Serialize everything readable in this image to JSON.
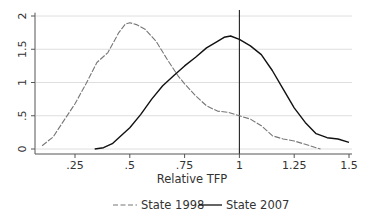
{
  "chart_data": {
    "type": "line",
    "title": "",
    "xlabel": "Relative TFP",
    "ylabel": "",
    "xlim": [
      0.08,
      1.52
    ],
    "ylim": [
      0,
      2.05
    ],
    "grid": true,
    "legend_position": "bottom",
    "x_ticks": [
      0.25,
      0.5,
      0.75,
      1,
      1.25,
      1.5
    ],
    "x_tick_labels": [
      ".25",
      ".5",
      ".75",
      "1",
      "1.25",
      "1.5"
    ],
    "y_ticks": [
      0,
      0.5,
      1,
      1.5,
      2
    ],
    "y_tick_labels": [
      "0",
      ".5",
      "1",
      "1.5",
      "2"
    ],
    "reference_line": {
      "axis": "x",
      "value": 1
    },
    "series": [
      {
        "name": "State 1998",
        "style": "dashed",
        "color": "#777777",
        "x": [
          0.1,
          0.15,
          0.2,
          0.25,
          0.3,
          0.35,
          0.4,
          0.45,
          0.48,
          0.5,
          0.53,
          0.57,
          0.62,
          0.67,
          0.72,
          0.75,
          0.8,
          0.85,
          0.9,
          0.95,
          1.0,
          1.05,
          1.1,
          1.15,
          1.2,
          1.25,
          1.3,
          1.35,
          1.37
        ],
        "y": [
          0.05,
          0.18,
          0.43,
          0.68,
          0.98,
          1.3,
          1.45,
          1.75,
          1.88,
          1.9,
          1.87,
          1.8,
          1.62,
          1.35,
          1.1,
          0.98,
          0.8,
          0.65,
          0.57,
          0.55,
          0.5,
          0.45,
          0.35,
          0.2,
          0.15,
          0.12,
          0.07,
          0.02,
          0.0
        ]
      },
      {
        "name": "State 2007",
        "style": "solid",
        "color": "#111111",
        "x": [
          0.34,
          0.38,
          0.42,
          0.46,
          0.5,
          0.55,
          0.6,
          0.65,
          0.7,
          0.75,
          0.8,
          0.85,
          0.9,
          0.93,
          0.96,
          1.0,
          1.05,
          1.1,
          1.15,
          1.2,
          1.25,
          1.3,
          1.35,
          1.4,
          1.45,
          1.5
        ],
        "y": [
          0.0,
          0.02,
          0.08,
          0.2,
          0.32,
          0.52,
          0.75,
          0.95,
          1.1,
          1.25,
          1.38,
          1.52,
          1.62,
          1.68,
          1.7,
          1.65,
          1.55,
          1.42,
          1.18,
          0.9,
          0.62,
          0.4,
          0.23,
          0.17,
          0.15,
          0.1
        ]
      }
    ]
  },
  "legend": {
    "items": [
      {
        "label": "State 1998",
        "style": "dashed"
      },
      {
        "label": "State 2007",
        "style": "solid"
      }
    ]
  }
}
